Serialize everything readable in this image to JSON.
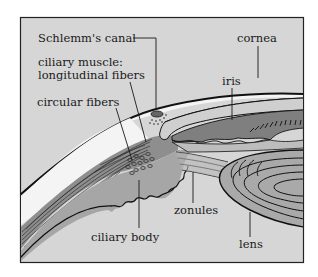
{
  "figure": {
    "colors": {
      "background": "#d6d6d6",
      "frame": "#222222",
      "sclera_band": "#f4f4f4",
      "muscle": "#8e8e8e",
      "iris": "#7f7f7f",
      "lens": "#a9a9a9",
      "ink": "#1a1a1a"
    }
  },
  "labels": {
    "schlemms_canal": "Schlemm's canal",
    "ciliary_muscle_line1": "ciliary muscle:",
    "ciliary_muscle_line2": "longitudinal fibers",
    "circular_fibers": "circular fibers",
    "cornea": "cornea",
    "iris": "iris",
    "zonules": "zonules",
    "ciliary_body": "ciliary body",
    "lens": "lens"
  }
}
